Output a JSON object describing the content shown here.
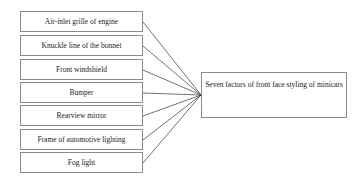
{
  "diagram": {
    "factors": [
      {
        "label": "Air-inlet grille of engine"
      },
      {
        "label": "Knuckle line of the bonnet"
      },
      {
        "label": "Front windshield"
      },
      {
        "label": "Bumper"
      },
      {
        "label": "Rearview mirror"
      },
      {
        "label": "Frame of automotive lighting"
      },
      {
        "label": "Fog light"
      }
    ],
    "target": {
      "label": "Seven factors of front face styling of minicars"
    },
    "colors": {
      "border": "#8a8a8a",
      "line": "#333333",
      "text": "#222222"
    }
  }
}
